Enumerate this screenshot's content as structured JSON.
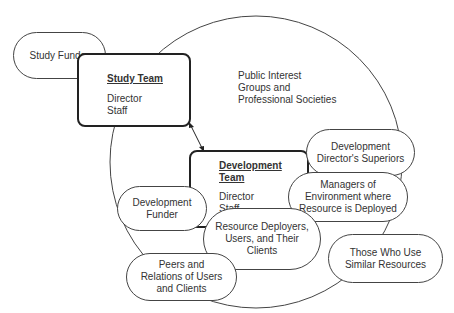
{
  "diagram": {
    "study_funder": "Study Funder",
    "study_team": {
      "title": "Study Team",
      "members": [
        "Director",
        "Staff"
      ]
    },
    "public_interest": [
      "Public Interest",
      "Groups and",
      "Professional Societies"
    ],
    "development_team": {
      "title": "Development Team",
      "members": [
        "Director",
        "Staff"
      ]
    },
    "dev_director_superiors": [
      "Development",
      "Director's Superiors"
    ],
    "managers_env": [
      "Managers of",
      "Environment where",
      "Resource is Deployed"
    ],
    "development_funder": [
      "Development",
      "Funder"
    ],
    "resource_deployers": [
      "Resource Deployers,",
      "Users, and Their",
      "Clients"
    ],
    "those_who_use": [
      "Those Who Use",
      "Similar Resources"
    ],
    "peers_relations": [
      "Peers and",
      "Relations of Users",
      "and Clients"
    ],
    "colors": {
      "stroke": "#444444",
      "text": "#333333",
      "background": "#ffffff"
    }
  }
}
